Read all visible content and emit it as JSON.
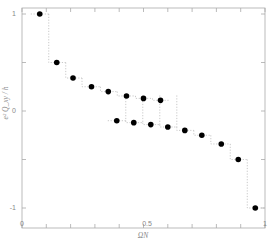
{
  "chart_data": {
    "type": "scatter",
    "title": "",
    "xlabel": "ΩN",
    "ylabel": "e² Q_xy / h",
    "xlim": [
      0,
      1
    ],
    "ylim": [
      -1.05,
      1.05
    ],
    "x_ticks": [
      0,
      0.1,
      0.2,
      0.3,
      0.4,
      0.5,
      0.6,
      0.7,
      0.8,
      0.9,
      1
    ],
    "x_tick_labels": [
      "0",
      "",
      "",
      "",
      "",
      "0.5",
      "",
      "",
      "",
      "",
      "1"
    ],
    "y_ticks": [
      -1,
      -0.5,
      0,
      0.5,
      1
    ],
    "y_tick_labels": [
      "-1",
      "",
      "0",
      "",
      "1"
    ],
    "grid": false,
    "legend": null,
    "marker": "filled-circle",
    "marker_color": "#000000",
    "dotted_step_lines": true,
    "series": [
      {
        "name": "upper branch",
        "x": [
          0.073,
          0.143,
          0.21,
          0.286,
          0.355,
          0.43,
          0.5,
          0.57
        ],
        "y": [
          1.0,
          0.5,
          0.34,
          0.25,
          0.2,
          0.155,
          0.13,
          0.11
        ]
      },
      {
        "name": "lower branch",
        "x": [
          0.39,
          0.46,
          0.53,
          0.6,
          0.67,
          0.74,
          0.82,
          0.89,
          0.96
        ],
        "y": [
          -0.1,
          -0.12,
          -0.14,
          -0.165,
          -0.2,
          -0.25,
          -0.34,
          -0.5,
          -1.0
        ]
      }
    ]
  },
  "labels": {
    "x_axis_title": "ΩN",
    "y_axis_title": "e² Q_xy / h",
    "x_tick_0": "0",
    "x_tick_05": "0.5",
    "x_tick_1": "1",
    "y_tick_1": "1",
    "y_tick_0": "0",
    "y_tick_m1": "-1"
  }
}
